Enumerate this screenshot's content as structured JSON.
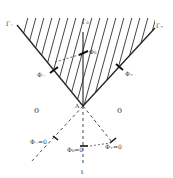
{
  "diagram": {
    "colors": {
      "ink": "#222222",
      "hatch": "#444444",
      "background": "#ffffff"
    },
    "curves": {
      "gamma_minus": "Γ₋",
      "gamma_zero": "Γ₀",
      "gamma_plus": "Γ₊"
    },
    "arrows_upper": {
      "phi_minus": "Φ₋",
      "phi_zero": "Φ₀",
      "phi_plus": "Φ₊"
    },
    "vertex": "A",
    "regions": {
      "left": "0",
      "right": "0"
    },
    "arrows_lower": {
      "phi_minus_zero": "Φ₋=0",
      "phi_zero_zero": "Φ₀=0",
      "phi_plus_zero": "Φ₊=0"
    },
    "axis_label": "t"
  }
}
